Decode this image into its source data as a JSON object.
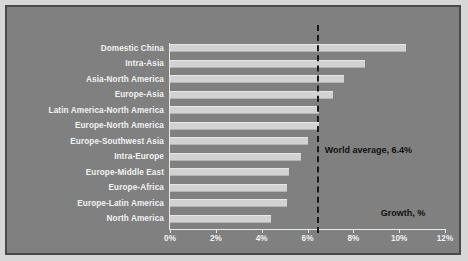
{
  "chart_data": {
    "type": "bar",
    "orientation": "horizontal",
    "title": "",
    "subtitle": "",
    "xlabel": "Growth, %",
    "ylabel": "",
    "xlim": [
      0,
      12
    ],
    "xtick_labels": [
      "0%",
      "2%",
      "4%",
      "6%",
      "8%",
      "10%",
      "12%"
    ],
    "xtick_values": [
      0,
      2,
      4,
      6,
      8,
      10,
      12
    ],
    "grid": false,
    "legend": null,
    "categories": [
      "Domestic China",
      "Intra-Asia",
      "Asia-North America",
      "Europe-Asia",
      "Latin America-North America",
      "Europe-North America",
      "Europe-Southwest Asia",
      "Intra-Europe",
      "Europe-Middle East",
      "Europe-Africa",
      "Europe-Latin America",
      "North America"
    ],
    "values": [
      10.3,
      8.5,
      7.6,
      7.1,
      6.5,
      6.5,
      6.0,
      5.7,
      5.2,
      5.1,
      5.1,
      4.4
    ],
    "annotations": [
      {
        "name": "world-average-line",
        "text": "World average, 6.4%",
        "value": 6.4,
        "style": "dashed-vertical-line"
      }
    ],
    "colors": {
      "background": "#808080",
      "page_background": "#d7d7d7",
      "border": "#4a4a4a",
      "bar_fill": "#d2d2d2",
      "axis": "#e8e8e8",
      "tick_label": "#f2f2f2",
      "category_label": "#f2f2f2",
      "annotation_text": "#101010",
      "reference_line": "#1a1a1a"
    }
  }
}
